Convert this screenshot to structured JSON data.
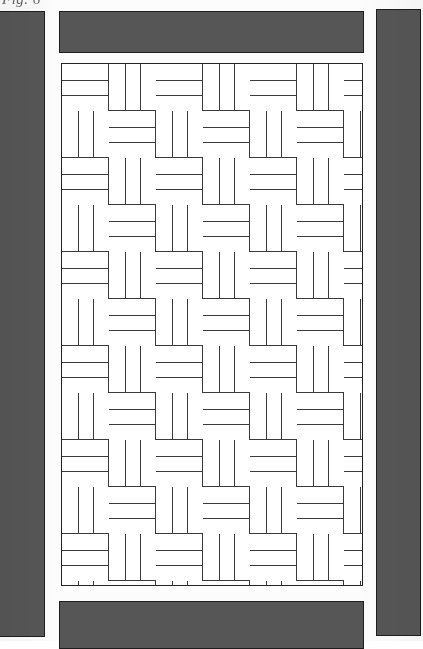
{
  "document": {
    "type": "patent-drawing",
    "caption": "Fig. 6",
    "caption_visible_fragment": "Fig. 6",
    "sheet_background": "#fcfcfc"
  },
  "colors": {
    "slab_fill": "#565656",
    "slab_outline": "#1d1d1d",
    "line": "#3a3a3a",
    "panel_border": "#232323",
    "paper": "#ffffff"
  },
  "layout": {
    "width": 423,
    "height": 641
  },
  "slabs": [
    {
      "id": "slab-left",
      "label": "Left border slab",
      "x": -3,
      "y": 11,
      "w": 48,
      "h": 626,
      "cropped": true
    },
    {
      "id": "slab-top",
      "label": "Top border slab",
      "x": 59,
      "y": 11,
      "w": 305,
      "h": 42,
      "cropped": false
    },
    {
      "id": "slab-right",
      "label": "Right border slab",
      "x": 376,
      "y": 9,
      "w": 45,
      "h": 627,
      "cropped": true
    },
    {
      "id": "slab-bottom",
      "label": "Bottom border slab",
      "x": 59,
      "y": 601,
      "w": 305,
      "h": 48,
      "cropped": true
    }
  ],
  "pattern": {
    "name": "Basketweave paving pattern",
    "alt_name": "Parquet weave",
    "panel": {
      "x": 61,
      "y": 63,
      "w": 302,
      "h": 523
    },
    "block_size": 47,
    "planks_per_block": 3,
    "columns": 7,
    "rows": 12,
    "orientation_rule": "alternating checkerboard: (row + column) even = horizontal planks, odd = vertical planks",
    "first_block_orientation": "horizontal"
  }
}
